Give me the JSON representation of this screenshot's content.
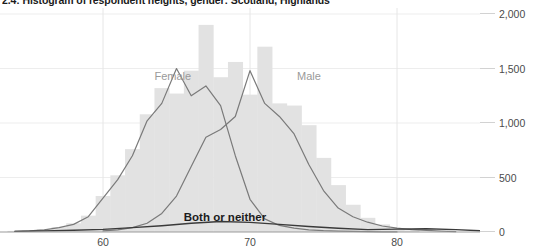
{
  "chart_data": {
    "type": "bar",
    "title": "2.4: Histogram of respondent heights, gender: Scotland, Highlands",
    "xlabel": "",
    "ylabel": "",
    "xlim": [
      53,
      88
    ],
    "ylim": [
      0,
      2000
    ],
    "grid": true,
    "legend_position": "inline-annotations",
    "y_ticks": [
      {
        "value": 2000,
        "label": "2,000"
      },
      {
        "value": 1500,
        "label": "1,500"
      },
      {
        "value": 1000,
        "label": "1,000"
      },
      {
        "value": 500,
        "label": "500"
      },
      {
        "value": 0,
        "label": "0"
      }
    ],
    "x_ticks": [
      {
        "value": 60,
        "label": "60"
      },
      {
        "value": 70,
        "label": "70"
      },
      {
        "value": 80,
        "label": "80"
      }
    ],
    "bar_color": "#e2e2e2",
    "line_color": "#7a7a7a",
    "dark_line_color": "#3a3a3a",
    "bins": [
      54,
      55,
      56,
      57,
      58,
      59,
      60,
      61,
      62,
      63,
      64,
      65,
      66,
      67,
      68,
      69,
      70,
      71,
      72,
      73,
      74,
      75,
      76,
      77,
      78,
      79,
      80,
      81
    ],
    "bin_width": 1,
    "histogram_total": [
      10,
      15,
      25,
      45,
      80,
      150,
      330,
      520,
      760,
      1080,
      1320,
      1270,
      1480,
      1900,
      1420,
      1560,
      1260,
      1700,
      1180,
      1160,
      980,
      680,
      430,
      250,
      130,
      70,
      30,
      15
    ],
    "series": [
      {
        "name": "Female",
        "label_x": 63.5,
        "label_y": 1420,
        "x": [
          54,
          55,
          56,
          57,
          58,
          59,
          60,
          61,
          62,
          63,
          64,
          65,
          66,
          67,
          68,
          69,
          70,
          71,
          72,
          73,
          74,
          75,
          76,
          77,
          78,
          79,
          80
        ],
        "values": [
          5,
          10,
          20,
          40,
          70,
          140,
          310,
          480,
          700,
          1020,
          1180,
          1500,
          1250,
          1340,
          1160,
          700,
          300,
          120,
          60,
          35,
          20,
          12,
          8,
          5,
          3,
          2,
          1
        ]
      },
      {
        "name": "Male",
        "label_x": 73.2,
        "label_y": 1420,
        "x": [
          60,
          61,
          62,
          63,
          64,
          65,
          66,
          67,
          68,
          69,
          70,
          71,
          72,
          73,
          74,
          75,
          76,
          77,
          78,
          79,
          80,
          81,
          82,
          83,
          84
        ],
        "values": [
          10,
          20,
          40,
          80,
          170,
          330,
          600,
          870,
          940,
          1060,
          1480,
          1180,
          1060,
          900,
          620,
          380,
          220,
          140,
          90,
          55,
          35,
          22,
          14,
          8,
          4
        ]
      },
      {
        "name": "Both or neither",
        "label_x": 68.3,
        "label_y": 130,
        "dark": true,
        "x": [
          54,
          56,
          58,
          60,
          62,
          64,
          66,
          68,
          70,
          72,
          74,
          76,
          78,
          80,
          82,
          84,
          86
        ],
        "values": [
          6,
          10,
          16,
          24,
          40,
          58,
          80,
          96,
          88,
          70,
          50,
          34,
          22,
          26,
          30,
          22,
          10
        ]
      }
    ]
  }
}
